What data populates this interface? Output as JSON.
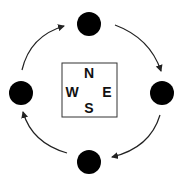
{
  "diagram": {
    "compass": {
      "north": "N",
      "west": "W",
      "east": "E",
      "south": "S"
    },
    "nodes": [
      {
        "position": "top"
      },
      {
        "position": "right"
      },
      {
        "position": "bottom"
      },
      {
        "position": "left"
      }
    ],
    "flow_direction": "clockwise",
    "colors": {
      "node": "#000000",
      "arrow": "#222222",
      "box_border": "#333333"
    }
  }
}
